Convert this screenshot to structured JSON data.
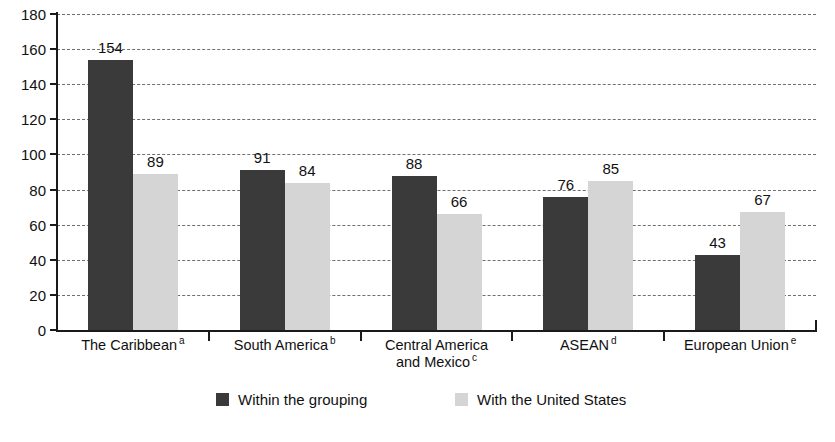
{
  "chart_data": {
    "type": "bar",
    "title": "",
    "subtitle": "",
    "xlabel": "",
    "ylabel": "",
    "ylim": [
      0,
      180
    ],
    "ytick_step": 20,
    "yticks": [
      0,
      20,
      40,
      60,
      80,
      100,
      120,
      140,
      160,
      180
    ],
    "grid": true,
    "grid_style": "dashed horizontal",
    "legend_position": "bottom",
    "categories": [
      "The Caribbean",
      "South America",
      "Central America and Mexico",
      "ASEAN",
      "European Union"
    ],
    "category_footnotes": [
      "a",
      "b",
      "c",
      "d",
      "e"
    ],
    "category_lines": [
      [
        "The Caribbean"
      ],
      [
        "South America"
      ],
      [
        "Central America",
        "and Mexico"
      ],
      [
        "ASEAN"
      ],
      [
        "European Union"
      ]
    ],
    "series": [
      {
        "name": "Within the grouping",
        "color": "#3a3a3a",
        "values": [
          154,
          91,
          88,
          76,
          43
        ]
      },
      {
        "name": "With the United States",
        "color": "#d5d5d5",
        "values": [
          89,
          84,
          66,
          85,
          67
        ]
      }
    ]
  },
  "legend": {
    "items": [
      {
        "label": "Within the grouping",
        "color": "#3a3a3a"
      },
      {
        "label": "With the United States",
        "color": "#d5d5d5"
      }
    ]
  },
  "colors": {
    "series_dark": "#3a3a3a",
    "series_light": "#d5d5d5",
    "axis": "#1a1a1a",
    "grid": "#6f6f6f",
    "background": "#ffffff",
    "text": "#111111"
  }
}
